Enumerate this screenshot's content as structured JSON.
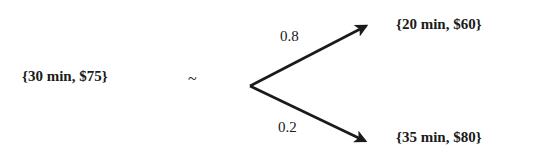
{
  "diagram": {
    "type": "lottery-equivalence",
    "certain_option": "{30 min, $75}",
    "relation_symbol": "~",
    "branches": [
      {
        "probability": "0.8",
        "outcome": "{20 min, $60}"
      },
      {
        "probability": "0.2",
        "outcome": "{35 min, $80}"
      }
    ],
    "colors": {
      "ink": "#1a1a1a",
      "background": "#ffffff"
    }
  }
}
